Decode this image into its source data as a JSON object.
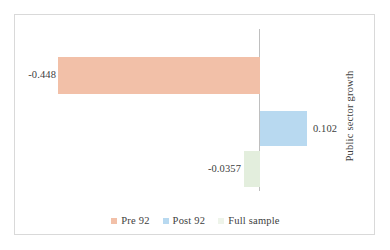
{
  "chart_data": {
    "type": "bar",
    "orientation": "horizontal",
    "title": "",
    "xlabel": "",
    "ylabel": "Public sector growth",
    "categories": [
      "Public sector growth"
    ],
    "grid": false,
    "legend_position": "bottom",
    "zero_line": true,
    "xlim": [
      -0.55,
      0.22
    ],
    "series": [
      {
        "name": "Pre 92",
        "values": [
          -0.448
        ],
        "data_label": "-0.448",
        "color": "#f2c0a8"
      },
      {
        "name": "Post 92",
        "values": [
          0.102
        ],
        "data_label": "0.102",
        "color": "#b8d9f0"
      },
      {
        "name": "Full sample",
        "values": [
          -0.0357
        ],
        "data_label": "-0.0357",
        "color": "#e3eedd"
      }
    ]
  },
  "axis": {
    "vertical_title": "Public sector growth"
  },
  "labels": {
    "pre92": "-0.448",
    "post92": "0.102",
    "full_sample": "-0.0357"
  },
  "legend": {
    "items": [
      {
        "label": "Pre  92",
        "color": "#f2c0a8"
      },
      {
        "label": "Post  92",
        "color": "#b8d9f0"
      },
      {
        "label": "Full sample",
        "color": "#eef4ea"
      }
    ]
  },
  "colors": {
    "pre92": "#f2c0a8",
    "post92": "#b8d9f0",
    "full_sample": "#e3eedd",
    "axis_line": "#bfbfbf",
    "frame": "#d9d9d9",
    "text": "#404040"
  }
}
